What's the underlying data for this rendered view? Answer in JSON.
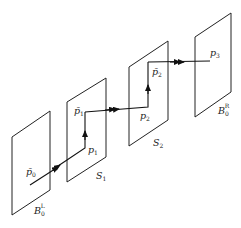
{
  "diagram": {
    "planes": [
      {
        "id": "B0L",
        "label": "B",
        "sub": "0",
        "sup": "L"
      },
      {
        "id": "S1",
        "label": "S",
        "sub": "1"
      },
      {
        "id": "S2",
        "label": "S",
        "sub": "2"
      },
      {
        "id": "B0R",
        "label": "B",
        "sub": "0",
        "sup": "R"
      }
    ],
    "points": [
      {
        "id": "pbar0",
        "label": "p̄",
        "sub": "0"
      },
      {
        "id": "p1",
        "label": "p",
        "sub": "1"
      },
      {
        "id": "pbar1",
        "label": "p̄",
        "sub": "1"
      },
      {
        "id": "p2",
        "label": "p",
        "sub": "2"
      },
      {
        "id": "pbar2",
        "label": "p̄",
        "sub": "2"
      },
      {
        "id": "p3",
        "label": "p",
        "sub": "3"
      }
    ]
  }
}
